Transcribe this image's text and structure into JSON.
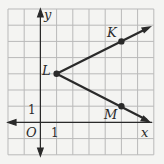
{
  "figure": {
    "grid": {
      "xmin": -2,
      "xmax": 7,
      "ymin": -2,
      "ymax": 7,
      "step": 1
    },
    "axes": {
      "x_label": "x",
      "y_label": "y",
      "origin_label": "O",
      "x_tick_label": "1",
      "y_tick_label": "1"
    },
    "points": [
      {
        "name": "L",
        "x": 1,
        "y": 3
      },
      {
        "name": "K",
        "x": 5,
        "y": 5
      },
      {
        "name": "M",
        "x": 5,
        "y": 1
      }
    ],
    "rays": [
      {
        "name": "ray-LK",
        "from": "L",
        "through": "K"
      },
      {
        "name": "ray-LM",
        "from": "L",
        "through": "M"
      }
    ],
    "colors": {
      "grid": "#b9b9b9",
      "ink": "#2a2a2a",
      "background": "#f4f4f2"
    }
  }
}
